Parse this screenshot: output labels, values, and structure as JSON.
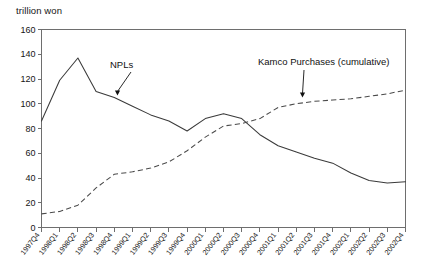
{
  "chart_data": {
    "type": "line",
    "title": "",
    "ylabel": "trillion won",
    "xlabel": "",
    "ylim": [
      0,
      160
    ],
    "ytick_step": 20,
    "yticks": [
      0,
      20,
      40,
      60,
      80,
      100,
      120,
      140,
      160
    ],
    "grid": false,
    "legend": "none",
    "annotations": [
      {
        "name": "npl-annotation",
        "text": "NPLs",
        "points_to_series": "NPLs",
        "points_to_category": "1998Q4"
      },
      {
        "name": "kamco-annotation",
        "text": "Kamco Purchases (cumulative)",
        "points_to_series": "Kamco Purchases (cumulative)",
        "points_to_category": "2001Q3"
      }
    ],
    "categories": [
      "1997Q4",
      "1998Q1",
      "1998Q2",
      "1998Q3",
      "1998Q4",
      "1999Q1",
      "1999Q2",
      "1999Q3",
      "1999Q4",
      "2000Q1",
      "2000Q2",
      "2000Q3",
      "2000Q4",
      "2001Q1",
      "2001Q2",
      "2001Q3",
      "2001Q4",
      "2002Q1",
      "2002Q2",
      "2002Q3",
      "2002Q4"
    ],
    "series": [
      {
        "name": "NPLs",
        "style": "solid",
        "values": [
          86,
          119,
          137,
          110,
          105,
          98,
          91,
          86,
          78,
          88,
          92,
          88,
          75,
          66,
          61,
          56,
          52,
          44,
          38,
          36,
          37
        ]
      },
      {
        "name": "Kamco Purchases (cumulative)",
        "style": "dashed",
        "values": [
          11,
          13,
          18,
          32,
          43,
          45,
          48,
          53,
          62,
          73,
          82,
          84,
          88,
          97,
          100,
          102,
          103,
          104,
          106,
          108,
          111
        ]
      }
    ]
  },
  "axes": {
    "y_unit_caption": "trillion won"
  }
}
